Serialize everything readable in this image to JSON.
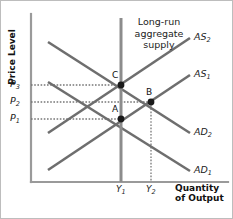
{
  "figure": {
    "kind": "aggregate-demand-aggregate-supply-diagram",
    "colors": {
      "curve": "#6e6e6e",
      "lras": "#8c8c8c",
      "axis": "#9a9a9a",
      "frame": "#bdbdbd",
      "dotted": "#777777",
      "point": "#1a1a1a",
      "text": "#222222"
    }
  },
  "axes": {
    "y_title": "Price Level",
    "x_title_line1": "Quantity",
    "x_title_line2": "of Output",
    "y_ticks": [
      {
        "base": "P",
        "sub": "3",
        "y": 85
      },
      {
        "base": "P",
        "sub": "2",
        "y": 102
      },
      {
        "base": "P",
        "sub": "1",
        "y": 119
      }
    ],
    "x_ticks": [
      {
        "base": "Y",
        "sub": "1",
        "x": 121
      },
      {
        "base": "Y",
        "sub": "2",
        "x": 151
      }
    ]
  },
  "lras": {
    "label_line1": "Long-run",
    "label_line2": "aggregate",
    "label_line3": "supply",
    "x": 121,
    "y_top": 18,
    "y_bottom": 182
  },
  "curves": [
    {
      "base": "AS",
      "sub": "2",
      "label_x": 194,
      "label_y": 31,
      "x1": 48,
      "y1": 133,
      "x2": 190,
      "y2": 38
    },
    {
      "base": "AS",
      "sub": "1",
      "label_x": 194,
      "label_y": 68,
      "x1": 48,
      "y1": 170,
      "x2": 190,
      "y2": 75
    },
    {
      "base": "AD",
      "sub": "2",
      "label_x": 194,
      "label_y": 126,
      "x1": 48,
      "y1": 42,
      "x2": 190,
      "y2": 133
    },
    {
      "base": "AD",
      "sub": "1",
      "label_x": 194,
      "label_y": 164,
      "x1": 48,
      "y1": 82,
      "x2": 190,
      "y2": 171
    }
  ],
  "points": [
    {
      "label": "C",
      "x": 121,
      "y": 85,
      "label_x": 112,
      "label_y": 70
    },
    {
      "label": "B",
      "x": 151,
      "y": 102,
      "label_x": 146,
      "label_y": 87
    },
    {
      "label": "A",
      "x": 121,
      "y": 119,
      "label_x": 112,
      "label_y": 104
    }
  ],
  "guides": {
    "horizontal": [
      {
        "from_x": 31,
        "to_x": 121,
        "y": 85
      },
      {
        "from_x": 31,
        "to_x": 151,
        "y": 102
      },
      {
        "from_x": 31,
        "to_x": 121,
        "y": 119
      }
    ],
    "vertical": [
      {
        "x": 151,
        "from_y": 102,
        "to_y": 182
      }
    ]
  },
  "chart_data": {
    "type": "line",
    "title": "",
    "xlabel": "Quantity of Output",
    "ylabel": "Price Level",
    "x_tick_labels": [
      "Y1",
      "Y2"
    ],
    "y_tick_labels": [
      "P1",
      "P2",
      "P3"
    ],
    "legend": [
      "AS2",
      "AS1",
      "AD2",
      "AD1",
      "Long-run aggregate supply"
    ],
    "equilibria": [
      {
        "name": "A",
        "quantity": "Y1",
        "price": "P1"
      },
      {
        "name": "B",
        "quantity": "Y2",
        "price": "P2"
      },
      {
        "name": "C",
        "quantity": "Y1",
        "price": "P3"
      }
    ]
  }
}
